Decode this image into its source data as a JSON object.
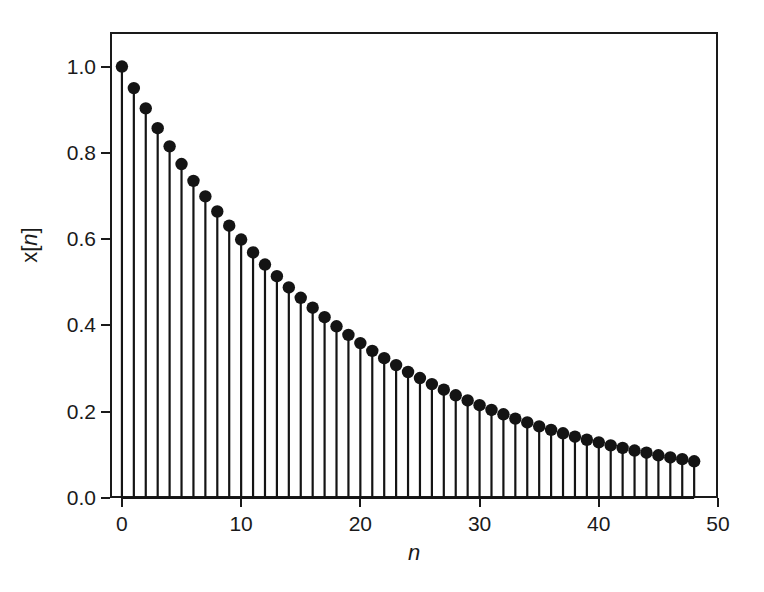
{
  "chart_data": {
    "type": "stem",
    "title": "",
    "subtitle": "",
    "xlabel": "n",
    "ylabel": "x[n]",
    "ylabel_parts": {
      "prefix": "x[",
      "variable": "n",
      "suffix": "]"
    },
    "xlim": [
      -1,
      50
    ],
    "ylim": [
      0.0,
      1.08
    ],
    "grid": false,
    "legend": null,
    "baseline": 0.0,
    "marker": "filled-circle",
    "marker_color": "#141414",
    "stem_color": "#141414",
    "frame_color": "#1a1a1a",
    "background": "#ffffff",
    "xticks": [
      0,
      10,
      20,
      30,
      40,
      50
    ],
    "xtick_labels": [
      "0",
      "10",
      "20",
      "30",
      "40",
      "50"
    ],
    "yticks": [
      0.0,
      0.2,
      0.4,
      0.6,
      0.8,
      1.0
    ],
    "ytick_labels": [
      "0.0",
      "0.2",
      "0.4",
      "0.6",
      "0.8",
      "1.0"
    ],
    "x": [
      0,
      1,
      2,
      3,
      4,
      5,
      6,
      7,
      8,
      9,
      10,
      11,
      12,
      13,
      14,
      15,
      16,
      17,
      18,
      19,
      20,
      21,
      22,
      23,
      24,
      25,
      26,
      27,
      28,
      29,
      30,
      31,
      32,
      33,
      34,
      35,
      36,
      37,
      38,
      39,
      40,
      41,
      42,
      43,
      44,
      45,
      46,
      47,
      48
    ],
    "values": [
      1.0,
      0.95,
      0.903,
      0.857,
      0.815,
      0.774,
      0.735,
      0.699,
      0.664,
      0.631,
      0.599,
      0.569,
      0.541,
      0.514,
      0.488,
      0.464,
      0.441,
      0.419,
      0.398,
      0.378,
      0.359,
      0.341,
      0.324,
      0.308,
      0.292,
      0.278,
      0.264,
      0.251,
      0.238,
      0.226,
      0.215,
      0.204,
      0.194,
      0.184,
      0.175,
      0.166,
      0.158,
      0.15,
      0.142,
      0.135,
      0.129,
      0.122,
      0.116,
      0.11,
      0.105,
      0.099,
      0.094,
      0.09,
      0.085
    ]
  }
}
